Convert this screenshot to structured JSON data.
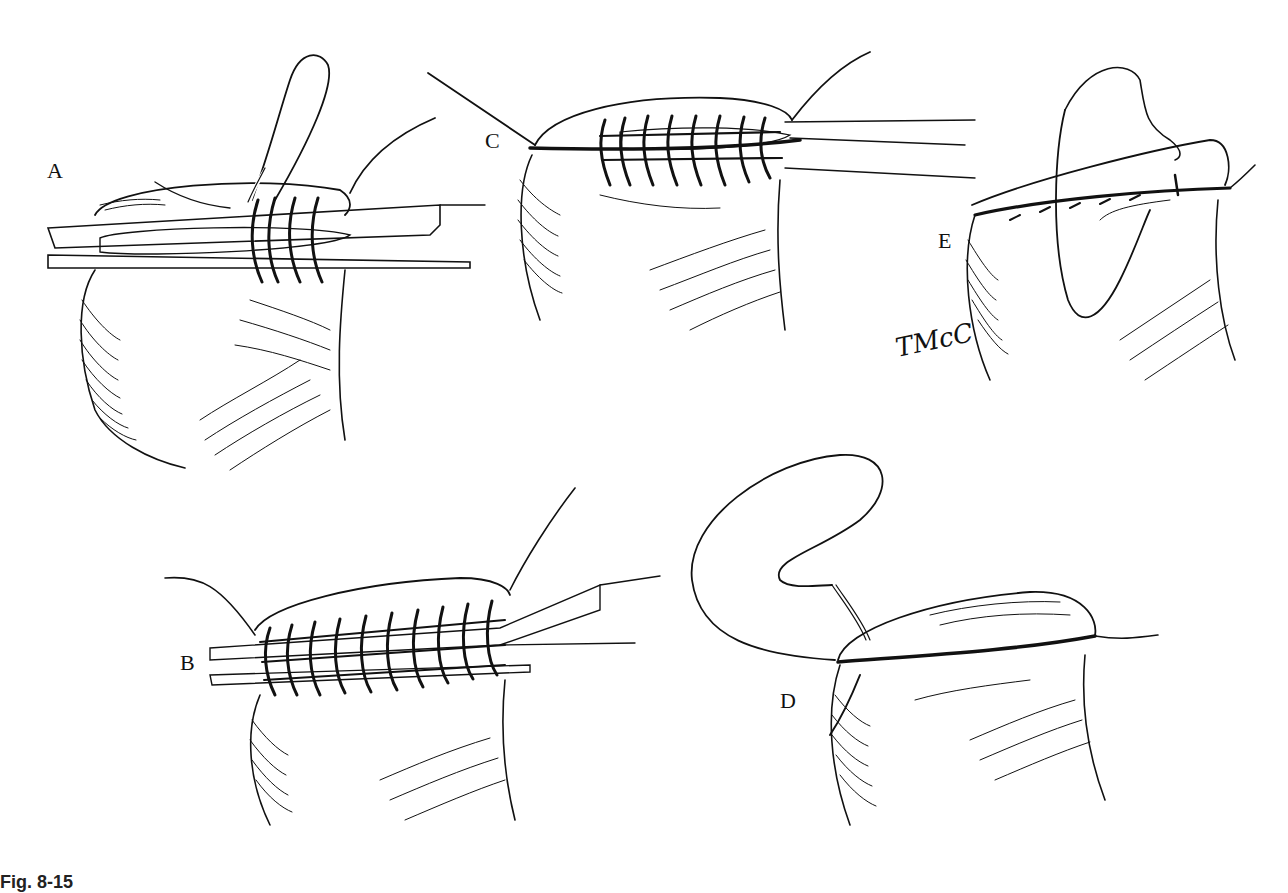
{
  "figure": {
    "panels": [
      {
        "id": "A",
        "label": "A",
        "description": "Clamp across stump; first sutures looped over clamp with needle loop above"
      },
      {
        "id": "B",
        "label": "B",
        "description": "Row of over-and-over sutures placed around clamp along full length"
      },
      {
        "id": "C",
        "label": "C",
        "description": "Clamp being withdrawn from beneath completed suture row"
      },
      {
        "id": "D",
        "label": "D",
        "description": "Suture ends pulled taut, closing the stump edge; needle with long loop"
      },
      {
        "id": "E",
        "label": "E",
        "description": "Second continuous suture layer running back over the closed edge"
      }
    ],
    "signature": "TMcC",
    "caption": "Fig. 8-15"
  },
  "colors": {
    "ink": "#111111",
    "background": "#ffffff"
  }
}
